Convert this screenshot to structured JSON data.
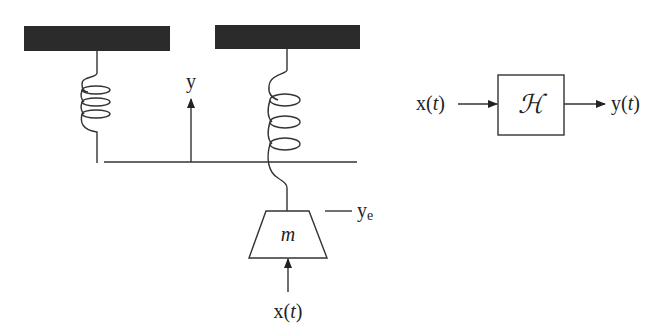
{
  "spring_mass": {
    "displacement_label": "y",
    "equilibrium_label": "y",
    "equilibrium_subscript": "e",
    "mass_label": "m",
    "input_label_x": "x(",
    "input_label_t": "t",
    "input_label_close": ")"
  },
  "block_diagram": {
    "input_x": "x(",
    "input_t": "t",
    "input_close": ")",
    "system_label": "ℋ",
    "output_y": "y(",
    "output_t": "t",
    "output_close": ")"
  },
  "colors": {
    "support_fill": "#2b2b2b",
    "line": "#333333",
    "background": "#ffffff"
  }
}
